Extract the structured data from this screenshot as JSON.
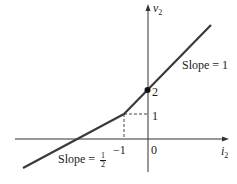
{
  "diagram": {
    "type": "piecewise-linear-characteristic",
    "axes": {
      "x_label": "i",
      "x_label_sub": "2",
      "y_label": "v",
      "y_label_sub": "2"
    },
    "tick_labels": {
      "x_neg1": "−1",
      "x_zero": "0",
      "y_one": "1",
      "y_two": "2"
    },
    "annotations": {
      "slope_upper": "Slope = 1",
      "slope_lower_prefix": "Slope = ",
      "slope_lower_num": "1",
      "slope_lower_den": "2"
    },
    "points": {
      "breakpoint": {
        "i": -1,
        "v": 1
      },
      "intercept": {
        "i": 0,
        "v": 2
      }
    },
    "segments": [
      {
        "name": "lower",
        "slope": 0.5,
        "range": "i < -1"
      },
      {
        "name": "upper",
        "slope": 1,
        "range": "i > -1"
      }
    ],
    "colors": {
      "line": "#3a3a3a",
      "axis": "#333333",
      "text": "#1a1a1a"
    }
  }
}
